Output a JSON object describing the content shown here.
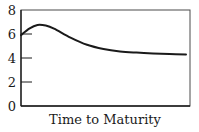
{
  "chart_data": {
    "type": "line",
    "title": "",
    "xlabel": "Time to Maturity",
    "ylabel": "",
    "ylim": [
      0,
      8
    ],
    "yticks": [
      0,
      2,
      4,
      6,
      8
    ],
    "ytick_labels": [
      "0",
      "2",
      "4",
      "6",
      "8"
    ],
    "xticks": [],
    "grid": false,
    "legend": null,
    "series": [
      {
        "name": "yield curve",
        "x": [
          0,
          0.05,
          0.1,
          0.15,
          0.2,
          0.3,
          0.4,
          0.5,
          0.6,
          0.7,
          0.8,
          0.9,
          1.0
        ],
        "values": [
          5.9,
          6.45,
          6.75,
          6.7,
          6.45,
          5.7,
          5.1,
          4.75,
          4.55,
          4.45,
          4.38,
          4.33,
          4.3
        ]
      }
    ],
    "colors": {
      "line": "#1a1a1a",
      "axes": "#2a2a2a"
    }
  }
}
